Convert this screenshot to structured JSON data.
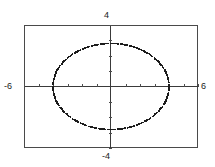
{
  "graph": {
    "window": {
      "xmin_label": "-6",
      "xmax_label": "6",
      "ymin_label": "-4",
      "ymax_label": "4"
    },
    "colors": {
      "frame": "#4a4a4a",
      "axis": "#3a3a3a",
      "curve": "#1c1c1c",
      "background": "#ffffff",
      "text": "#1a1a1a"
    }
  },
  "chart_data": {
    "type": "line",
    "title": "",
    "xlabel": "",
    "ylabel": "",
    "xlim": [
      -6,
      6
    ],
    "ylim": [
      -4,
      4
    ],
    "grid": false,
    "legend": null,
    "tick_labels": {
      "x": [
        "-6",
        "6"
      ],
      "y": [
        "-4",
        "4"
      ]
    },
    "render_style": "dotted",
    "series": [
      {
        "name": "ellipse",
        "shape": "ellipse",
        "center": [
          0,
          0
        ],
        "semi_axis_x": 4.0,
        "semi_axis_y": 2.8,
        "equation": "x^2/16 + y^2/7.84 = 1",
        "x_intercepts": [
          -4.0,
          4.0
        ],
        "y_intercepts": [
          -2.8,
          2.8
        ],
        "points": [
          [
            4.0,
            0.0
          ],
          [
            3.95,
            0.44
          ],
          [
            3.8,
            0.87
          ],
          [
            3.56,
            1.27
          ],
          [
            3.24,
            1.65
          ],
          [
            2.83,
            1.98
          ],
          [
            2.35,
            2.27
          ],
          [
            1.81,
            2.5
          ],
          [
            1.24,
            2.66
          ],
          [
            0.63,
            2.76
          ],
          [
            0.0,
            2.8
          ],
          [
            -0.63,
            2.76
          ],
          [
            -1.24,
            2.66
          ],
          [
            -1.81,
            2.5
          ],
          [
            -2.35,
            2.27
          ],
          [
            -2.83,
            1.98
          ],
          [
            -3.24,
            1.65
          ],
          [
            -3.56,
            1.27
          ],
          [
            -3.8,
            0.87
          ],
          [
            -3.95,
            0.44
          ],
          [
            -4.0,
            0.0
          ],
          [
            -3.95,
            -0.44
          ],
          [
            -3.8,
            -0.87
          ],
          [
            -3.56,
            -1.27
          ],
          [
            -3.24,
            -1.65
          ],
          [
            -2.83,
            -1.98
          ],
          [
            -2.35,
            -2.27
          ],
          [
            -1.81,
            -2.5
          ],
          [
            -1.24,
            -2.66
          ],
          [
            -0.63,
            -2.76
          ],
          [
            0.0,
            -2.8
          ],
          [
            0.63,
            -2.76
          ],
          [
            1.24,
            -2.66
          ],
          [
            1.81,
            -2.5
          ],
          [
            2.35,
            -2.27
          ],
          [
            2.83,
            -1.98
          ],
          [
            3.24,
            -1.65
          ],
          [
            3.56,
            -1.27
          ],
          [
            3.8,
            -0.87
          ],
          [
            3.95,
            -0.44
          ]
        ]
      }
    ]
  }
}
